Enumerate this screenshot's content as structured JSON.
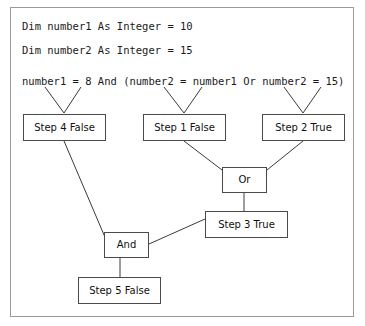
{
  "code": {
    "declaration_1": "Dim number1 As Integer = 10",
    "declaration_2": "Dim number2 As Integer = 15",
    "expression": "number1 = 8 And (number2 = number1 Or number2 = 15)"
  },
  "nodes": {
    "step4": "Step 4 False",
    "step1": "Step 1 False",
    "step2": "Step 2 True",
    "or": "Or",
    "step3": "Step 3 True",
    "and": "And",
    "step5": "Step 5 False"
  },
  "colors": {
    "frame_border": "#9a9a9a",
    "node_border": "#4a4a4a",
    "connector": "#3a3a3a",
    "background": "#ffffff",
    "text": "#101010"
  }
}
